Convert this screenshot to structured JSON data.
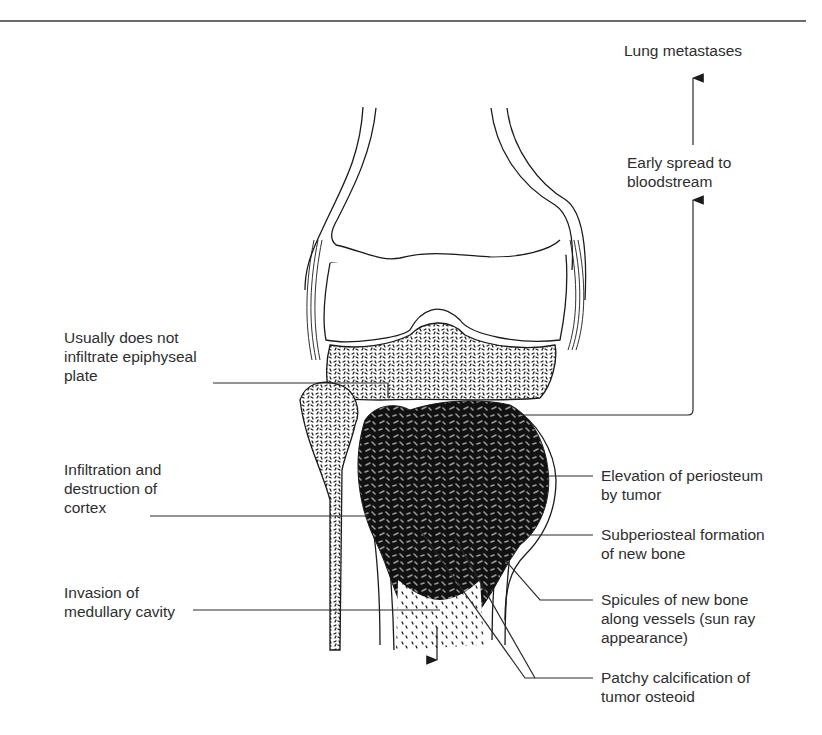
{
  "diagram": {
    "colors": {
      "background": "#ffffff",
      "ink": "#1a1a1a",
      "text": "#2e2e2e",
      "tumor_shade": "#8a8a8a",
      "rule": "#3a3a3a"
    },
    "top_labels": {
      "lung_metastases": "Lung metastases",
      "early_spread": [
        "Early spread to",
        "bloodstream"
      ]
    },
    "left_labels": [
      {
        "id": "epiphyseal",
        "lines": [
          "Usually does not",
          "infiltrate epiphyseal",
          "plate"
        ]
      },
      {
        "id": "cortex",
        "lines": [
          "Infiltration and",
          "destruction of",
          "cortex"
        ]
      },
      {
        "id": "medullary",
        "lines": [
          "Invasion of",
          "medullary cavity"
        ]
      }
    ],
    "right_labels": [
      {
        "id": "periosteum",
        "lines": [
          "Elevation of periosteum",
          "by tumor"
        ]
      },
      {
        "id": "subperiosteal",
        "lines": [
          "Subperiosteal formation",
          "of new bone"
        ]
      },
      {
        "id": "spicules",
        "lines": [
          "Spicules of new bone",
          "along vessels (sun ray",
          "appearance)"
        ]
      },
      {
        "id": "calcification",
        "lines": [
          "Patchy calcification of",
          "tumor osteoid"
        ]
      }
    ]
  }
}
